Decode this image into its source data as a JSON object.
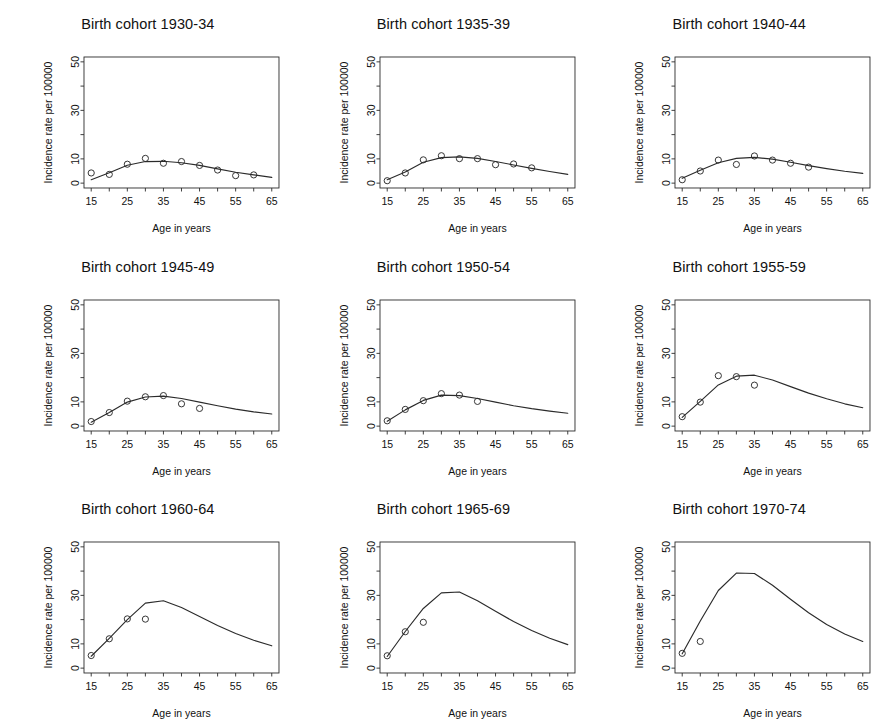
{
  "figure": {
    "type": "small-multiples-line-scatter",
    "panel_count": 9,
    "rows": 3,
    "columns": 3,
    "background_color": "#ffffff",
    "line_color": "#2b2b2b",
    "point_color": "#2b2b2b",
    "point_symbol": "open-circle"
  },
  "axes_common": {
    "xlabel": "Age in years",
    "ylabel": "Incidence rate per 100000",
    "xlim": [
      13,
      67
    ],
    "ylim": [
      -2,
      52
    ],
    "x_major_ticks": [
      15,
      25,
      35,
      45,
      55,
      65
    ],
    "x_minor_ticks": [
      20,
      30,
      40,
      50,
      60
    ],
    "x_tick_labels": [
      "15",
      "25",
      "35",
      "45",
      "55",
      "65"
    ],
    "y_major_ticks": [
      0,
      10,
      30,
      50
    ],
    "y_minor_ticks": [
      20,
      40
    ],
    "y_tick_labels": [
      "0",
      "10",
      "30",
      "50"
    ],
    "grid": false,
    "legend": "none"
  },
  "chart_data": [
    {
      "type": "scatter",
      "title": "Birth cohort 1930-34",
      "xlabel": "Age in years",
      "ylabel": "Incidence rate per 100000",
      "xlim": [
        13,
        67
      ],
      "ylim": [
        -2,
        52
      ],
      "series": [
        {
          "name": "Observed incidence",
          "kind": "points",
          "x": [
            15,
            20,
            25,
            30,
            35,
            40,
            45,
            50,
            55,
            60
          ],
          "values": [
            4.2,
            3.6,
            7.8,
            10.2,
            8.2,
            8.9,
            7.3,
            5.4,
            3.1,
            3.4
          ]
        },
        {
          "name": "Fitted age-period-cohort model",
          "kind": "line",
          "x": [
            15,
            20,
            25,
            30,
            35,
            40,
            45,
            50,
            55,
            60,
            65
          ],
          "values": [
            1.4,
            4.3,
            7.4,
            8.9,
            9.0,
            8.4,
            7.3,
            5.9,
            4.5,
            3.4,
            2.4
          ]
        }
      ]
    },
    {
      "type": "scatter",
      "title": "Birth cohort 1935-39",
      "xlabel": "Age in years",
      "ylabel": "Incidence rate per 100000",
      "xlim": [
        13,
        67
      ],
      "ylim": [
        -2,
        52
      ],
      "series": [
        {
          "name": "Observed incidence",
          "kind": "points",
          "x": [
            15,
            20,
            25,
            30,
            35,
            40,
            45,
            50,
            55
          ],
          "values": [
            1.0,
            4.2,
            9.6,
            11.3,
            10.1,
            10.1,
            7.6,
            7.9,
            6.3
          ]
        },
        {
          "name": "Fitted age-period-cohort model",
          "kind": "line",
          "x": [
            15,
            20,
            25,
            30,
            35,
            40,
            45,
            50,
            55,
            60,
            65
          ],
          "values": [
            1.4,
            4.6,
            8.6,
            10.5,
            10.8,
            10.2,
            8.9,
            7.5,
            6.1,
            4.8,
            3.6
          ]
        }
      ]
    },
    {
      "type": "scatter",
      "title": "Birth cohort 1940-44",
      "xlabel": "Age in years",
      "ylabel": "Incidence rate per 100000",
      "xlim": [
        13,
        67
      ],
      "ylim": [
        -2,
        52
      ],
      "series": [
        {
          "name": "Observed incidence",
          "kind": "points",
          "x": [
            15,
            20,
            25,
            30,
            35,
            40,
            45,
            50
          ],
          "values": [
            1.4,
            5.0,
            9.5,
            7.7,
            11.2,
            9.5,
            8.2,
            6.6
          ]
        },
        {
          "name": "Fitted age-period-cohort model",
          "kind": "line",
          "x": [
            15,
            20,
            25,
            30,
            35,
            40,
            45,
            50,
            55,
            60,
            65
          ],
          "values": [
            2.0,
            5.3,
            8.4,
            10.2,
            10.6,
            9.9,
            8.6,
            7.2,
            6.0,
            4.9,
            4.0
          ]
        }
      ]
    },
    {
      "type": "scatter",
      "title": "Birth cohort 1945-49",
      "xlabel": "Age in years",
      "ylabel": "Incidence rate per 100000",
      "xlim": [
        13,
        67
      ],
      "ylim": [
        -2,
        52
      ],
      "series": [
        {
          "name": "Observed incidence",
          "kind": "points",
          "x": [
            15,
            20,
            25,
            30,
            35,
            40,
            45
          ],
          "values": [
            1.9,
            5.6,
            10.3,
            12.1,
            12.6,
            9.2,
            7.3
          ]
        },
        {
          "name": "Fitted age-period-cohort model",
          "kind": "line",
          "x": [
            15,
            20,
            25,
            30,
            35,
            40,
            45,
            50,
            55,
            60,
            65
          ],
          "values": [
            1.6,
            5.6,
            9.9,
            12.0,
            12.4,
            11.4,
            9.9,
            8.4,
            7.0,
            5.9,
            5.0
          ]
        }
      ]
    },
    {
      "type": "scatter",
      "title": "Birth cohort 1950-54",
      "xlabel": "Age in years",
      "ylabel": "Incidence rate per 100000",
      "xlim": [
        13,
        67
      ],
      "ylim": [
        -2,
        52
      ],
      "series": [
        {
          "name": "Observed incidence",
          "kind": "points",
          "x": [
            15,
            20,
            25,
            30,
            35,
            40
          ],
          "values": [
            2.2,
            6.9,
            10.5,
            13.4,
            12.8,
            10.2
          ]
        },
        {
          "name": "Fitted age-period-cohort model",
          "kind": "line",
          "x": [
            15,
            20,
            25,
            30,
            35,
            40,
            45,
            50,
            55,
            60,
            65
          ],
          "values": [
            2.0,
            6.7,
            10.6,
            12.8,
            12.6,
            11.4,
            9.9,
            8.4,
            7.2,
            6.2,
            5.3
          ]
        }
      ]
    },
    {
      "type": "scatter",
      "title": "Birth cohort 1955-59",
      "xlabel": "Age in years",
      "ylabel": "Incidence rate per 100000",
      "xlim": [
        13,
        67
      ],
      "ylim": [
        -2,
        52
      ],
      "series": [
        {
          "name": "Observed incidence",
          "kind": "points",
          "x": [
            15,
            20,
            25,
            30,
            35
          ],
          "values": [
            3.9,
            9.9,
            20.8,
            20.4,
            16.9
          ]
        },
        {
          "name": "Fitted age-period-cohort model",
          "kind": "line",
          "x": [
            15,
            20,
            25,
            30,
            35,
            40,
            45,
            50,
            55,
            60,
            65
          ],
          "values": [
            3.6,
            10.2,
            17.0,
            20.6,
            21.0,
            19.0,
            16.3,
            13.6,
            11.3,
            9.2,
            7.6
          ]
        }
      ]
    },
    {
      "type": "scatter",
      "title": "Birth cohort 1960-64",
      "xlabel": "Age in years",
      "ylabel": "Incidence rate per 100000",
      "xlim": [
        13,
        67
      ],
      "ylim": [
        -2,
        52
      ],
      "series": [
        {
          "name": "Observed incidence",
          "kind": "points",
          "x": [
            15,
            20,
            25,
            30
          ],
          "values": [
            5.2,
            12.1,
            20.3,
            20.2
          ]
        },
        {
          "name": "Fitted age-period-cohort model",
          "kind": "line",
          "x": [
            15,
            20,
            25,
            30,
            35,
            40,
            45,
            50,
            55,
            60,
            65
          ],
          "values": [
            4.9,
            12.3,
            20.0,
            26.8,
            27.8,
            25.0,
            21.3,
            17.6,
            14.3,
            11.5,
            9.2
          ]
        }
      ]
    },
    {
      "type": "scatter",
      "title": "Birth cohort 1965-69",
      "xlabel": "Age in years",
      "ylabel": "Incidence rate per 100000",
      "xlim": [
        13,
        67
      ],
      "ylim": [
        -2,
        52
      ],
      "series": [
        {
          "name": "Observed incidence",
          "kind": "points",
          "x": [
            15,
            20,
            25
          ],
          "values": [
            5.1,
            15.0,
            18.9
          ]
        },
        {
          "name": "Fitted age-period-cohort model",
          "kind": "line",
          "x": [
            15,
            20,
            25,
            30,
            35,
            40,
            45,
            50,
            55,
            60,
            65
          ],
          "values": [
            4.8,
            15.1,
            24.6,
            31.0,
            31.4,
            27.8,
            23.5,
            19.2,
            15.5,
            12.3,
            9.7
          ]
        }
      ]
    },
    {
      "type": "scatter",
      "title": "Birth cohort 1970-74",
      "xlabel": "Age in years",
      "ylabel": "Incidence rate per 100000",
      "xlim": [
        13,
        67
      ],
      "ylim": [
        -2,
        52
      ],
      "series": [
        {
          "name": "Observed incidence",
          "kind": "points",
          "x": [
            15,
            20
          ],
          "values": [
            6.1,
            11.0
          ]
        },
        {
          "name": "Fitted age-period-cohort model",
          "kind": "line",
          "x": [
            15,
            20,
            25,
            30,
            35,
            40,
            45,
            50,
            55,
            60,
            65
          ],
          "values": [
            5.9,
            19.4,
            32.0,
            39.2,
            39.0,
            34.2,
            28.4,
            22.8,
            18.0,
            14.1,
            11.0
          ]
        }
      ]
    }
  ]
}
